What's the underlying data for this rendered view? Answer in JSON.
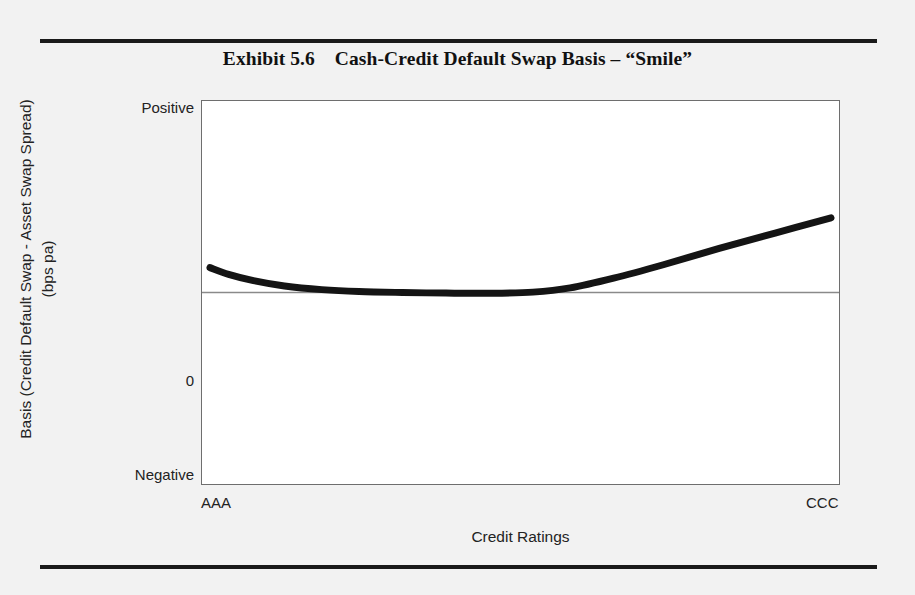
{
  "figure": {
    "title": "Exhibit 5.6    Cash-Credit Default Swap Basis – “Smile”",
    "background_color": "#f2f2f2",
    "rule_color": "#1a1a1a"
  },
  "chart_data": {
    "type": "line",
    "title": "Exhibit 5.6    Cash-Credit Default Swap Basis – “Smile”",
    "xlabel": "Credit Ratings",
    "ylabel_line1": "Basis (Credit Default Swap - Asset Swap Spread)",
    "ylabel_line2": "(bps pa)",
    "x_tick_labels": [
      "AAA",
      "CCC"
    ],
    "y_tick_labels": [
      "Positive",
      "0",
      "Negative"
    ],
    "xlim": [
      0,
      100
    ],
    "ylim": [
      -100,
      100
    ],
    "grid": false,
    "legend": "none",
    "zero_line": 0,
    "series": [
      {
        "name": "Cash-CDS basis smile",
        "line_color": "#141414",
        "line_width": 7,
        "x": [
          0,
          3,
          7,
          12,
          18,
          24,
          31,
          38,
          45,
          52,
          58,
          65,
          73,
          82,
          91,
          100
        ],
        "y": [
          13,
          9.5,
          6.2,
          3.4,
          1.5,
          0.5,
          0,
          -0.3,
          -0.4,
          0.2,
          2.4,
          7.5,
          14.5,
          23,
          31,
          39
        ]
      }
    ],
    "annotations": []
  }
}
